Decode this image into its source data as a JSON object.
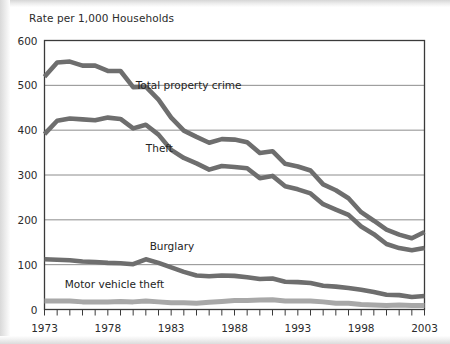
{
  "figure": {
    "title": "Rate per 1,000 Households",
    "background_color": "#ffffff",
    "frame_color": "#3a3a3a",
    "gridline_color": "#8c8c8c"
  },
  "chart_data": {
    "type": "line",
    "title": "Rate per 1,000 Households",
    "xlabel": "",
    "ylabel": "Rate per 1,000 Households",
    "xlim": [
      1973,
      2003
    ],
    "ylim": [
      0,
      600
    ],
    "ytick_labels": [
      "0",
      "100",
      "200",
      "300",
      "400",
      "500",
      "600"
    ],
    "ytick_values": [
      0,
      100,
      200,
      300,
      400,
      500,
      600
    ],
    "xtick_labels": [
      "1973",
      "1978",
      "1983",
      "1988",
      "1993",
      "1998",
      "2003"
    ],
    "xtick_values": [
      1973,
      1978,
      1983,
      1988,
      1993,
      1998,
      2003
    ],
    "minor_xticks": true,
    "grid": "horizontal",
    "legend": "inline-annotations",
    "x": [
      1973,
      1974,
      1975,
      1976,
      1977,
      1978,
      1979,
      1980,
      1981,
      1982,
      1983,
      1984,
      1985,
      1986,
      1987,
      1988,
      1989,
      1990,
      1991,
      1992,
      1993,
      1994,
      1995,
      1996,
      1997,
      1998,
      1999,
      2000,
      2001,
      2002,
      2003
    ],
    "series": [
      {
        "name": "Total property crime",
        "color": "#6e6e6e",
        "label_position": {
          "x": 1980.2,
          "y": 492
        },
        "values": [
          519,
          551,
          553,
          544,
          544,
          532,
          532,
          496,
          497,
          468,
          428,
          399,
          385,
          372,
          380,
          379,
          373,
          349,
          353,
          325,
          319,
          310,
          279,
          266,
          248,
          217,
          198,
          178,
          167,
          159,
          173
        ]
      },
      {
        "name": "Theft",
        "color": "#6e6e6e",
        "label_position": {
          "x": 1981.0,
          "y": 352
        },
        "values": [
          391,
          421,
          426,
          424,
          422,
          428,
          425,
          404,
          412,
          390,
          356,
          338,
          326,
          312,
          320,
          318,
          315,
          293,
          298,
          275,
          268,
          259,
          235,
          223,
          211,
          185,
          168,
          146,
          137,
          132,
          137
        ]
      },
      {
        "name": "Burglary",
        "color": "#6e6e6e",
        "label_position": {
          "x": 1981.3,
          "y": 133
        },
        "values": [
          112,
          111,
          110,
          107,
          106,
          104,
          103,
          101,
          112,
          104,
          94,
          84,
          76,
          74,
          76,
          75,
          72,
          68,
          69,
          62,
          61,
          59,
          53,
          51,
          48,
          44,
          39,
          33,
          32,
          28,
          30
        ]
      },
      {
        "name": "Motor vehicle theft",
        "color": "#a8a8a8",
        "label_position": {
          "x": 1974.6,
          "y": 48
        },
        "values": [
          19,
          19,
          19,
          17,
          17,
          17,
          18,
          17,
          19,
          17,
          15,
          15,
          14,
          16,
          18,
          20,
          20,
          21,
          22,
          19,
          19,
          19,
          17,
          14,
          14,
          11,
          10,
          9,
          10,
          9,
          9
        ]
      }
    ]
  },
  "annotations": {
    "total_property_crime": "Total property crime",
    "theft": "Theft",
    "burglary": "Burglary",
    "motor_vehicle_theft": "Motor vehicle theft"
  }
}
